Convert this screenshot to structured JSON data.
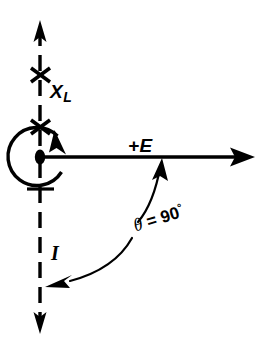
{
  "figure": {
    "type": "phasor-diagram",
    "title": "",
    "background_color": "#ffffff",
    "stroke_color": "#000000",
    "width": 267,
    "height": 345,
    "origin": {
      "x": 40,
      "y": 157
    }
  },
  "labels": {
    "inductive_reactance": "X",
    "inductive_reactance_sub": "L",
    "voltage": "+E",
    "current": "I",
    "angle_symbol": "θ",
    "angle_equals": "=",
    "angle_value": "90",
    "angle_degree": "°"
  },
  "axes": [
    {
      "name": "vertical-reactance-axis",
      "label": "X_L",
      "style": "dashed",
      "direction": "vertical",
      "from": {
        "x": 40,
        "y": 22
      },
      "to": {
        "x": 40,
        "y": 332
      },
      "arrowheads": [
        "up",
        "down"
      ],
      "tick_marks": 2
    },
    {
      "name": "horizontal-voltage-axis",
      "label": "+E",
      "style": "solid",
      "direction": "horizontal",
      "from": {
        "x": 40,
        "y": 157
      },
      "to": {
        "x": 253,
        "y": 157
      },
      "arrowheads": [
        "right"
      ]
    }
  ],
  "annotations": [
    {
      "name": "rotation-circle",
      "shape": "circle-with-arrow",
      "center": {
        "x": 40,
        "y": 157
      },
      "radius": 29,
      "arrow_direction": "counterclockwise-up-right"
    },
    {
      "name": "angle-arc",
      "shape": "double-headed-curve",
      "label": "θ = 90°",
      "from": {
        "x": 162,
        "y": 160
      },
      "to": {
        "x": 48,
        "y": 285
      }
    }
  ]
}
